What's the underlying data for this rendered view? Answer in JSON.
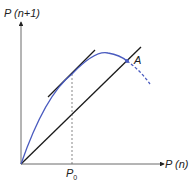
{
  "diagram": {
    "y_axis_label": "P (n+1)",
    "x_axis_label": "P (n)",
    "tick_label": "P",
    "tick_sub": "0",
    "point_label": "A",
    "curve_color": "#4a5bbf",
    "line_color": "#1a1a1a"
  }
}
